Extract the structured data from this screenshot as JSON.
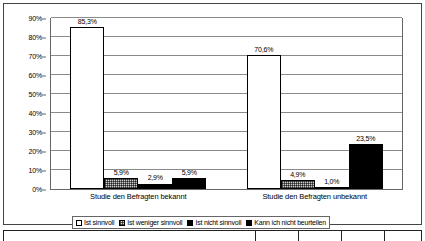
{
  "chart_data": {
    "type": "bar",
    "title": "",
    "subtitle": "",
    "xlabel": "",
    "ylabel": "",
    "ylim": [
      0,
      90
    ],
    "grid": true,
    "legend_position": "bottom",
    "categories": [
      "Studie den Befragten bekannt",
      "Studie den Befragten unbekannt"
    ],
    "series": [
      {
        "name": "Ist sinnvoll",
        "fill": "white",
        "values": [
          85.3,
          70.6
        ],
        "labels": [
          "85,3%",
          "70,6%"
        ]
      },
      {
        "name": "Ist weniger sinnvoll",
        "fill": "dotted",
        "values": [
          5.9,
          4.9
        ],
        "labels": [
          "5,9%",
          "4,9%"
        ]
      },
      {
        "name": "Ist nicht sinnvoll",
        "fill": "black",
        "values": [
          2.9,
          1.0
        ],
        "labels": [
          "2,9%",
          "1,0%"
        ]
      },
      {
        "name": "Kann ich nicht beurteilen",
        "fill": "black",
        "values": [
          5.9,
          23.5
        ],
        "labels": [
          "5,9%",
          "23,5%"
        ]
      }
    ],
    "yticks": [
      "0%",
      "10%",
      "20%",
      "30%",
      "40%",
      "50%",
      "60%",
      "70%",
      "80%",
      "90%"
    ],
    "ytick_values": [
      0,
      10,
      20,
      30,
      40,
      50,
      60,
      70,
      80,
      90
    ],
    "colors": {
      "bar_outline": "#000000",
      "plot_background": "#ffffff",
      "gridline": "#8a8a8a",
      "frame": "#444444",
      "text": "#000000",
      "dotted_fill": "#cfcfcf",
      "solid_fill": "#000000"
    }
  },
  "legend": {
    "items": [
      {
        "label": "Ist sinnvoll",
        "swatch": "white"
      },
      {
        "label": "Ist weniger sinnvoll",
        "swatch": "dotted"
      },
      {
        "label": "Ist nicht sinnvoll",
        "swatch": "black"
      },
      {
        "label": "Kann ich nicht beurteilen",
        "swatch": "black"
      }
    ]
  },
  "bottom_table": {
    "columns": [
      "",
      "",
      "",
      "",
      ""
    ],
    "widths": [
      132,
      43,
      43,
      43,
      36
    ]
  }
}
